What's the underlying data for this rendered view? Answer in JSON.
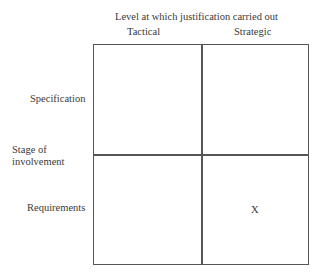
{
  "diagram": {
    "column_axis_title": "Level at which justification carried out",
    "columns": [
      "Tactical",
      "Strategic"
    ],
    "row_axis_title_line1": "Stage of",
    "row_axis_title_line2": "involvement",
    "rows": [
      "Specification",
      "Requirements"
    ],
    "cells": [
      [
        "",
        ""
      ],
      [
        "",
        "X"
      ]
    ],
    "marker": "X"
  }
}
